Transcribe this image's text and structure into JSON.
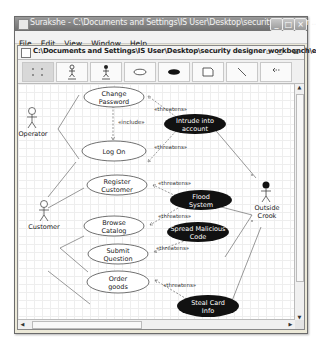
{
  "window": {
    "title": "Surakshe - C:\\Documents and Settings\\IS User\\Desktop\\security designer ...",
    "controls": [
      "minimize",
      "maximize",
      "close"
    ]
  },
  "menu": {
    "items": [
      {
        "label": "File"
      },
      {
        "label": "Edit"
      },
      {
        "label": "View"
      },
      {
        "label": "Window"
      },
      {
        "label": "Help"
      }
    ]
  },
  "document": {
    "path": "C:\\Documents and Settings\\IS User\\Desktop\\security designer workbench\\e-c...",
    "controls": [
      "restore",
      "maximize",
      "close"
    ]
  },
  "toolbar": {
    "tools": [
      {
        "name": "select-tool",
        "selected": true
      },
      {
        "name": "actor-tool"
      },
      {
        "name": "misactor-tool"
      },
      {
        "name": "use-case-tool"
      },
      {
        "name": "misuse-case-tool"
      },
      {
        "name": "system-boundary-tool"
      },
      {
        "name": "association-tool"
      },
      {
        "name": "relationship-tool"
      }
    ]
  },
  "diagram": {
    "actors": [
      {
        "id": "operator",
        "label": "Operator",
        "type": "actor"
      },
      {
        "id": "customer",
        "label": "Customer",
        "type": "actor"
      },
      {
        "id": "outside_crook",
        "label": "Outside Crook",
        "line1": "Outside",
        "line2": "Crook",
        "type": "misactor"
      }
    ],
    "use_cases": [
      {
        "id": "change_password",
        "line1": "Change",
        "line2": "Password"
      },
      {
        "id": "log_on",
        "line1": "Log On",
        "line2": ""
      },
      {
        "id": "register_customer",
        "line1": "Register",
        "line2": "Customer"
      },
      {
        "id": "browse_catalog",
        "line1": "Browse",
        "line2": "Catalog"
      },
      {
        "id": "submit_question",
        "line1": "Submit",
        "line2": "Question"
      },
      {
        "id": "order_goods",
        "line1": "Order",
        "line2": "goods"
      }
    ],
    "misuse_cases": [
      {
        "id": "intrude_account",
        "line1": "Intrude into",
        "line2": "account"
      },
      {
        "id": "flood_system",
        "line1": "Flood",
        "line2": "System"
      },
      {
        "id": "spread_malicious_code",
        "line1": "Spread Malicious",
        "line2": "Code"
      },
      {
        "id": "steal_card_info",
        "line1": "Steal Card",
        "line2": "Info"
      }
    ],
    "relationships": [
      {
        "from": "change_password",
        "to": "log_on",
        "label": "«include»"
      },
      {
        "from": "intrude_account",
        "to": "change_password",
        "label": "«threatens»"
      },
      {
        "from": "intrude_account",
        "to": "log_on",
        "label": "«threatens»"
      },
      {
        "from": "flood_system",
        "to": "register_customer",
        "label": "«threatens»"
      },
      {
        "from": "flood_system",
        "to": "browse_catalog",
        "label": "«threatens»"
      },
      {
        "from": "spread_malicious_code",
        "to": "submit_question",
        "label": "«threatens»"
      },
      {
        "from": "steal_card_info",
        "to": "order_goods",
        "label": "«threatens»"
      }
    ],
    "labels": {
      "include": "«include»",
      "threatens": "«threatens»"
    }
  }
}
